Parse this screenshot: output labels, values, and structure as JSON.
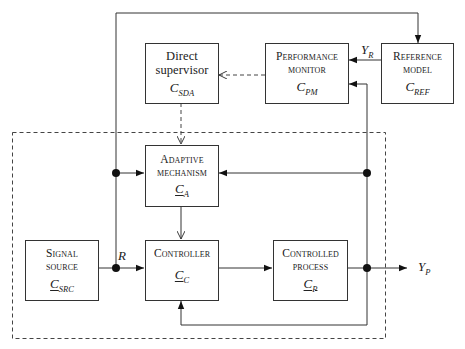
{
  "diagram": {
    "type": "block-diagram",
    "blocks": {
      "direct_supervisor": {
        "line1": "Direct",
        "line2": "supervisor",
        "symbol": "C",
        "subscript": "SDA"
      },
      "performance_monitor": {
        "line1": "Performance",
        "line2": "monitor",
        "symbol": "C",
        "subscript": "PM"
      },
      "reference_model": {
        "line1": "Reference",
        "line2": "model",
        "symbol": "C",
        "subscript": "REF"
      },
      "adaptive_mechanism": {
        "line1": "Adaptive",
        "line2": "mechanism",
        "symbol": "C",
        "subscript": "A"
      },
      "signal_source": {
        "line1": "Signal",
        "line2": "source",
        "symbol": "C",
        "subscript": "SRC"
      },
      "controller": {
        "line1": "Controller",
        "symbol": "C",
        "subscript": "C"
      },
      "controlled_process": {
        "line1": "Controlled",
        "line2": "process",
        "symbol": "C",
        "subscript": "P"
      }
    },
    "signals": {
      "reference": {
        "symbol": "R"
      },
      "reference_output": {
        "symbol": "Y",
        "subscript": "R"
      },
      "process_output": {
        "symbol": "Y",
        "subscript": "P"
      }
    },
    "colors": {
      "line": "#333333",
      "dashed": "#444444",
      "background": "#ffffff"
    }
  }
}
